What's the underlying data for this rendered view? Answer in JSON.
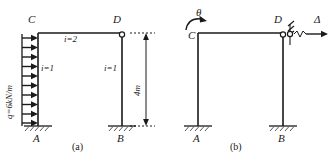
{
  "figure": {
    "type": "structural-frame-diagram",
    "panels": [
      {
        "id": "a",
        "caption": "(a)",
        "nodes": {
          "top_left": "C",
          "top_right": "D",
          "bottom_left": "A",
          "bottom_right": "B"
        },
        "load": {
          "label": "q=6kN/m",
          "direction": "horizontal-right",
          "arrow_count": 10,
          "applied_to": "left-column"
        },
        "members": {
          "beam_label": "i=2",
          "left_column_label": "i=1",
          "right_column_label": "i=1"
        },
        "dimension": {
          "label": "4m",
          "orientation": "vertical",
          "both_arrows": true
        },
        "supports": {
          "A": "fixed",
          "B": "fixed",
          "D": "hinge"
        }
      },
      {
        "id": "b",
        "caption": "(b)",
        "nodes": {
          "top_left": "C",
          "top_right": "D",
          "bottom_left": "A",
          "bottom_right": "B"
        },
        "rotation": {
          "label": "θ",
          "at_node": "C",
          "direction": "clockwise"
        },
        "displacement": {
          "label": "Δ",
          "at_node": "D",
          "direction": "horizontal-right"
        },
        "supports": {
          "A": "fixed",
          "B": "fixed",
          "D": "hinge-with-roller-hatch"
        }
      }
    ],
    "colors": {
      "line": "#1a1a1a",
      "background": "#ffffff",
      "text": "#1a1a1a"
    }
  }
}
